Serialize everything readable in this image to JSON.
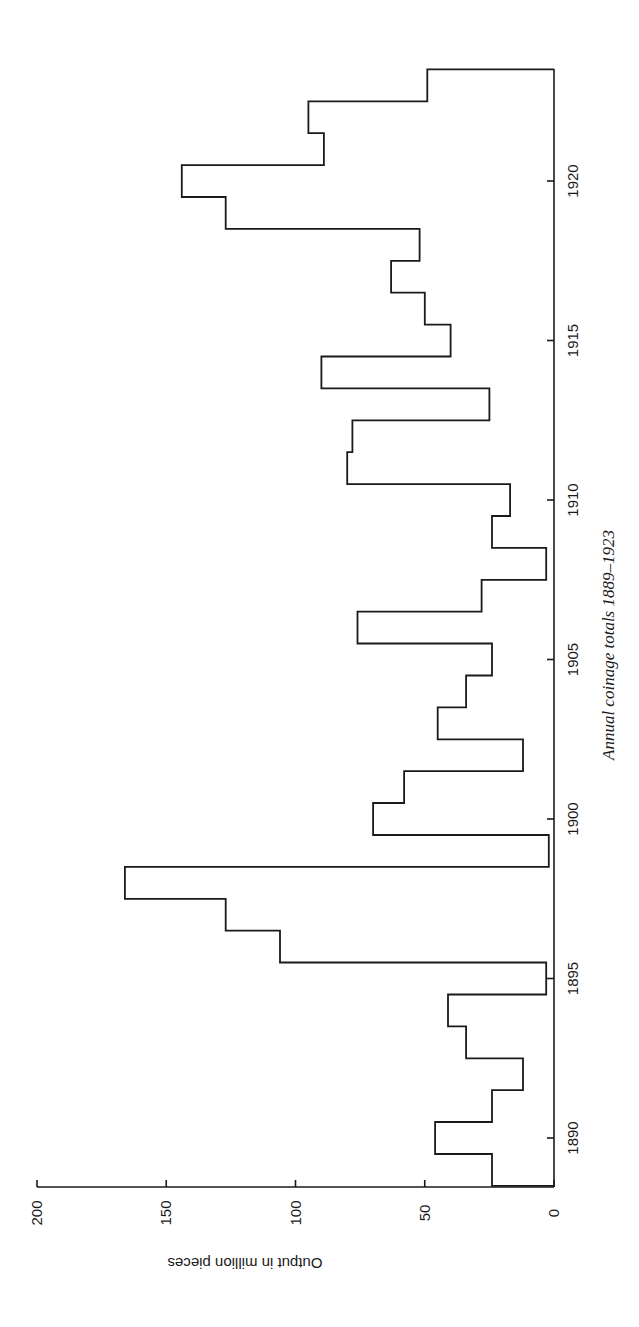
{
  "chart_data": {
    "type": "bar",
    "style": "step-histogram",
    "orientation": "rotated-90-clockwise",
    "title": "Annual coinage totals 1889–1923",
    "xlabel": "",
    "ylabel": "Output in million pieces",
    "x": [
      1889,
      1890,
      1891,
      1892,
      1893,
      1894,
      1895,
      1896,
      1897,
      1898,
      1899,
      1900,
      1901,
      1902,
      1903,
      1904,
      1905,
      1906,
      1907,
      1908,
      1909,
      1910,
      1911,
      1912,
      1913,
      1914,
      1915,
      1916,
      1917,
      1918,
      1919,
      1920,
      1921,
      1922,
      1923
    ],
    "series": [
      {
        "name": "Annual coinage output (million pieces)",
        "values": [
          24,
          46,
          24,
          12,
          34,
          41,
          3,
          106,
          127,
          166,
          2,
          70,
          58,
          12,
          45,
          34,
          24,
          76,
          28,
          3,
          24,
          17,
          80,
          78,
          25,
          90,
          40,
          50,
          63,
          52,
          127,
          144,
          89,
          95,
          49
        ]
      }
    ],
    "x_ticks": [
      "1890",
      "1895",
      "1900",
      "1905",
      "1910",
      "1915",
      "1920"
    ],
    "y_ticks": [
      "0",
      "50",
      "100",
      "150",
      "200"
    ],
    "ylim": [
      0,
      200
    ],
    "xlim": [
      1888.5,
      1923.5
    ],
    "grid": false,
    "legend": "none"
  },
  "labels": {
    "caption": "Annual coinage totals 1889–1923",
    "y_axis_title": "Output in million pieces"
  }
}
